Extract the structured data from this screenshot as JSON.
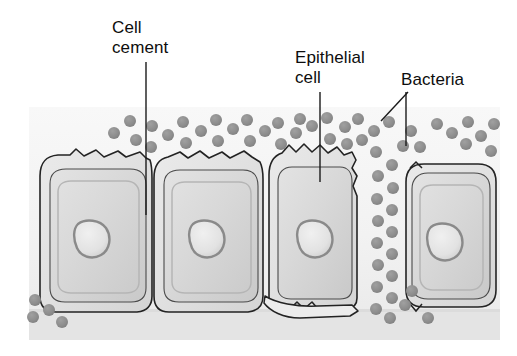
{
  "figure": {
    "kind": "biology-diagram",
    "background_color": "#ffffff",
    "panel": {
      "x": 29,
      "y": 107,
      "width": 471,
      "height": 233,
      "fill_top": "#f7f7f7",
      "fill_bottom": "#eaeaea",
      "basement_strip_fill": "#e3e3e3",
      "basement_strip_y": 312
    },
    "palette": {
      "outline": "#232323",
      "cell_fill_outer": "#e4e4e4",
      "cell_fill_inner": "#d7d7d7",
      "cell_fill_core": "#cfcfcf",
      "nucleus_ring": "#8f8f8f",
      "nucleus_fill": "#e6e6e6",
      "bacteria_fill": "#8d8d8d",
      "leader_line": "#1a1a1a"
    }
  },
  "labels": [
    {
      "id": "cell-cement",
      "lines": "Cell\ncement",
      "text_x": 112,
      "text_y": 18,
      "leader": {
        "type": "vertical",
        "x": 146,
        "y_start": 62,
        "y_end": 215
      }
    },
    {
      "id": "epithelial-cell",
      "lines": "Epithelial\ncell",
      "text_x": 295,
      "text_y": 48,
      "leader": {
        "type": "vertical",
        "x": 320,
        "y_start": 92,
        "y_end": 182
      }
    },
    {
      "id": "bacteria",
      "lines": "Bacteria",
      "text_x": 401,
      "text_y": 70,
      "leader_diagonal": {
        "x1": 408,
        "y1": 92,
        "x2": 381,
        "y2": 121
      },
      "leader_vertical": {
        "x": 406,
        "y_start": 92,
        "y_end": 146
      }
    }
  ],
  "cells": [
    {
      "name": "epithelial-cell-1",
      "position": "left",
      "outer_box": {
        "x": 38,
        "y": 155,
        "width": 112,
        "height": 158
      },
      "nucleus": {
        "cx": 94,
        "cy": 240,
        "rx": 16,
        "ry": 17
      },
      "apical_border": "wavy"
    },
    {
      "name": "epithelial-cell-2",
      "position": "center-left",
      "outer_box": {
        "x": 152,
        "y": 155,
        "width": 112,
        "height": 158
      },
      "nucleus": {
        "cx": 209,
        "cy": 240,
        "rx": 16,
        "ry": 17
      },
      "apical_border": "wavy"
    },
    {
      "name": "epithelial-cell-3",
      "position": "center-right",
      "outer_box": {
        "x": 267,
        "y": 150,
        "width": 90,
        "height": 163
      },
      "nucleus": {
        "cx": 316,
        "cy": 240,
        "rx": 16,
        "ry": 17
      },
      "apical_border": "wavy-jagged",
      "note": "narrower, detaching at base, bacteria along right margin"
    },
    {
      "name": "epithelial-cell-4",
      "position": "right",
      "outer_box": {
        "x": 404,
        "y": 163,
        "width": 93,
        "height": 145
      },
      "nucleus": {
        "cx": 446,
        "cy": 243,
        "rx": 16,
        "ry": 17
      },
      "apical_border": "smooth",
      "note": "separated from neighbours by bacterial column"
    }
  ],
  "bacteria": {
    "shape": "circle",
    "radius": 6,
    "fill": "#8d8d8d",
    "count": 61,
    "positions": [
      [
        114,
        133
      ],
      [
        130,
        121
      ],
      [
        136,
        140
      ],
      [
        152,
        126
      ],
      [
        151,
        147
      ],
      [
        168,
        135
      ],
      [
        183,
        122
      ],
      [
        186,
        143
      ],
      [
        201,
        131
      ],
      [
        216,
        120
      ],
      [
        218,
        141
      ],
      [
        233,
        129
      ],
      [
        247,
        120
      ],
      [
        250,
        141
      ],
      [
        265,
        131
      ],
      [
        278,
        123
      ],
      [
        281,
        144
      ],
      [
        296,
        133
      ],
      [
        300,
        119
      ],
      [
        312,
        126
      ],
      [
        327,
        118
      ],
      [
        330,
        139
      ],
      [
        345,
        127
      ],
      [
        358,
        119
      ],
      [
        347,
        144
      ],
      [
        362,
        140
      ],
      [
        374,
        131
      ],
      [
        389,
        122
      ],
      [
        403,
        146
      ],
      [
        376,
        152
      ],
      [
        392,
        165
      ],
      [
        378,
        176
      ],
      [
        393,
        188
      ],
      [
        377,
        199
      ],
      [
        392,
        210
      ],
      [
        378,
        221
      ],
      [
        392,
        232
      ],
      [
        377,
        243
      ],
      [
        392,
        254
      ],
      [
        378,
        265
      ],
      [
        392,
        276
      ],
      [
        377,
        287
      ],
      [
        392,
        298
      ],
      [
        376,
        309
      ],
      [
        390,
        318
      ],
      [
        405,
        305
      ],
      [
        411,
        131
      ],
      [
        420,
        147
      ],
      [
        437,
        124
      ],
      [
        452,
        133
      ],
      [
        468,
        122
      ],
      [
        481,
        136
      ],
      [
        494,
        124
      ],
      [
        466,
        144
      ],
      [
        491,
        151
      ],
      [
        35,
        300
      ],
      [
        33,
        317
      ],
      [
        49,
        310
      ],
      [
        62,
        322
      ],
      [
        412,
        291
      ],
      [
        428,
        318
      ]
    ]
  }
}
